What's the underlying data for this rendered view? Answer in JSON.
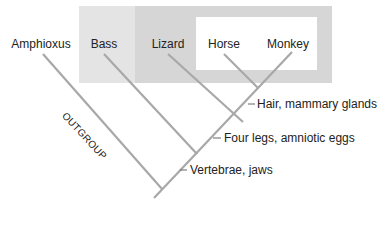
{
  "diagram": {
    "type": "cladogram",
    "taxa": [
      {
        "label": "Amphioxus",
        "x": 41
      },
      {
        "label": "Bass",
        "x": 104
      },
      {
        "label": "Lizard",
        "x": 168
      },
      {
        "label": "Horse",
        "x": 224
      },
      {
        "label": "Monkey",
        "x": 286
      }
    ],
    "traits": [
      {
        "label": "Hair, mammary glands"
      },
      {
        "label": "Four legs, amniotic eggs"
      },
      {
        "label": "Vertebrae, jaws"
      }
    ],
    "outgroup_label": "OUTGROUP",
    "colors": {
      "line": "#a8a8a8",
      "outer_box": "#e4e4e4",
      "middle_box": "#d6d6d6",
      "inner_box": "#ffffff",
      "text": "#222222"
    }
  }
}
